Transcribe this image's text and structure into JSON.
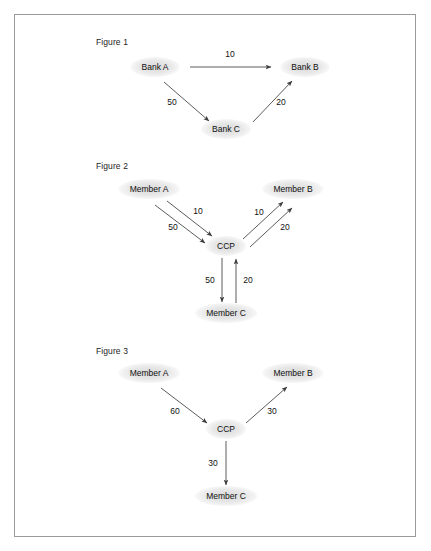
{
  "page": {
    "background_color": "#ffffff",
    "frame_border_color": "#9a9a9a",
    "edge_color": "#4a4a4a",
    "node_fill_color": "#d6d6d6",
    "text_color": "#111111",
    "header_faint_text": ""
  },
  "figures": [
    {
      "id": "figure-1",
      "label": "Figure 1",
      "label_pos": {
        "x": 81,
        "y": 22
      },
      "nodes": [
        {
          "id": "bank-a",
          "label": "Bank A",
          "x": 140,
          "y": 52
        },
        {
          "id": "bank-b",
          "label": "Bank B",
          "x": 290,
          "y": 52
        },
        {
          "id": "bank-c",
          "label": "Bank C",
          "x": 211,
          "y": 114
        }
      ],
      "edges": [
        {
          "id": "a-to-b",
          "from": "bank-a",
          "to": "bank-b",
          "value": "10",
          "x1": 175,
          "y1": 52,
          "x2": 256,
          "y2": 52,
          "label_x": 215,
          "label_y": 39
        },
        {
          "id": "a-to-c",
          "from": "bank-a",
          "to": "bank-c",
          "value": "50",
          "x1": 149,
          "y1": 67,
          "x2": 194,
          "y2": 106,
          "label_x": 157,
          "label_y": 87
        },
        {
          "id": "c-to-b",
          "from": "bank-c",
          "to": "bank-b",
          "value": "20",
          "x1": 238,
          "y1": 107,
          "x2": 277,
          "y2": 66,
          "label_x": 266,
          "label_y": 87
        }
      ]
    },
    {
      "id": "figure-2",
      "label": "Figure 2",
      "label_pos": {
        "x": 81,
        "y": 146
      },
      "nodes": [
        {
          "id": "member-a",
          "label": "Member A",
          "x": 134,
          "y": 174
        },
        {
          "id": "member-b",
          "label": "Member B",
          "x": 278,
          "y": 174
        },
        {
          "id": "ccp",
          "label": "CCP",
          "x": 211,
          "y": 231
        },
        {
          "id": "member-c",
          "label": "Member C",
          "x": 211,
          "y": 298
        }
      ],
      "edges": [
        {
          "id": "a-to-ccp-10",
          "from": "member-a",
          "to": "ccp",
          "value": "10",
          "x1": 152,
          "y1": 186,
          "x2": 197,
          "y2": 221,
          "label_x": 183,
          "label_y": 196
        },
        {
          "id": "a-to-ccp-50",
          "from": "member-a",
          "to": "ccp",
          "value": "50",
          "x1": 140,
          "y1": 190,
          "x2": 190,
          "y2": 228,
          "label_x": 158,
          "label_y": 212
        },
        {
          "id": "ccp-to-b-10",
          "from": "ccp",
          "to": "member-b",
          "value": "10",
          "x1": 228,
          "y1": 224,
          "x2": 268,
          "y2": 187,
          "label_x": 244,
          "label_y": 197
        },
        {
          "id": "ccp-to-b-20",
          "from": "ccp",
          "to": "member-b",
          "value": "20",
          "x1": 235,
          "y1": 232,
          "x2": 277,
          "y2": 193,
          "label_x": 270,
          "label_y": 212
        },
        {
          "id": "ccp-to-c-50",
          "from": "ccp",
          "to": "member-c",
          "value": "50",
          "x1": 207,
          "y1": 243,
          "x2": 207,
          "y2": 287,
          "label_x": 195,
          "label_y": 265
        },
        {
          "id": "c-to-ccp-20",
          "from": "member-c",
          "to": "ccp",
          "value": "20",
          "x1": 221,
          "y1": 288,
          "x2": 221,
          "y2": 244,
          "label_x": 233,
          "label_y": 265
        }
      ]
    },
    {
      "id": "figure-3",
      "label": "Figure 3",
      "label_pos": {
        "x": 81,
        "y": 331
      },
      "nodes": [
        {
          "id": "member-a",
          "label": "Member A",
          "x": 134,
          "y": 358
        },
        {
          "id": "member-b",
          "label": "Member B",
          "x": 278,
          "y": 358
        },
        {
          "id": "ccp",
          "label": "CCP",
          "x": 211,
          "y": 414
        },
        {
          "id": "member-c",
          "label": "Member C",
          "x": 211,
          "y": 481
        }
      ],
      "edges": [
        {
          "id": "a-to-ccp-60",
          "from": "member-a",
          "to": "ccp",
          "value": "60",
          "x1": 146,
          "y1": 373,
          "x2": 192,
          "y2": 408,
          "label_x": 160,
          "label_y": 396
        },
        {
          "id": "ccp-to-b-30",
          "from": "ccp",
          "to": "member-b",
          "value": "30",
          "x1": 231,
          "y1": 408,
          "x2": 272,
          "y2": 372,
          "label_x": 257,
          "label_y": 396
        },
        {
          "id": "ccp-to-c-30",
          "from": "ccp",
          "to": "member-c",
          "value": "30",
          "x1": 211,
          "y1": 426,
          "x2": 211,
          "y2": 470,
          "label_x": 198,
          "label_y": 448
        }
      ]
    }
  ]
}
